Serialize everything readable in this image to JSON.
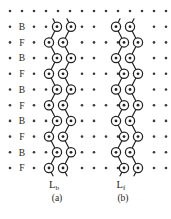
{
  "figure": {
    "colors": {
      "background": "#ffffff",
      "ink": "#222222",
      "dot": "#3a3a3a",
      "site_fill": "#ffffff"
    },
    "grid": {
      "x0": 10,
      "dx": 12,
      "cols": 14,
      "y0": 11,
      "dy": 15.7,
      "rows": 11
    },
    "row_labels": [
      "B",
      "F",
      "B",
      "F",
      "B",
      "F",
      "B",
      "F",
      "B",
      "F"
    ],
    "row_label_x": 22,
    "dot_columns": {
      "row0": [
        10,
        22,
        34,
        46,
        58,
        70,
        82,
        94,
        106,
        118,
        130,
        142,
        154,
        166
      ],
      "b_rows": [
        10,
        34,
        46,
        82,
        94,
        154,
        166
      ],
      "f_rows": [
        10,
        34,
        82,
        94,
        106,
        118,
        154,
        166
      ]
    },
    "dot_radius": 1.3,
    "site": {
      "radius": 4.6,
      "center_dot_radius": 1.4,
      "stroke_width": 1.25
    },
    "bond_stroke_width": 1.2,
    "ladders": [
      {
        "name": "left-ladder",
        "label": "L",
        "subscript": "b",
        "caption": "(a)",
        "label_x": 54,
        "caption_x": 57,
        "chains": [
          {
            "bx": 57,
            "fx": 49
          },
          {
            "bx": 71,
            "fx": 63
          }
        ]
      },
      {
        "name": "right-ladder",
        "label": "L",
        "subscript": "f",
        "caption": "(b)",
        "label_x": 121,
        "caption_x": 123,
        "chains": [
          {
            "bx": 116,
            "fx": 124
          },
          {
            "bx": 130,
            "fx": 138
          }
        ]
      }
    ],
    "label_baseline_y": 188,
    "caption_baseline_y": 201
  }
}
